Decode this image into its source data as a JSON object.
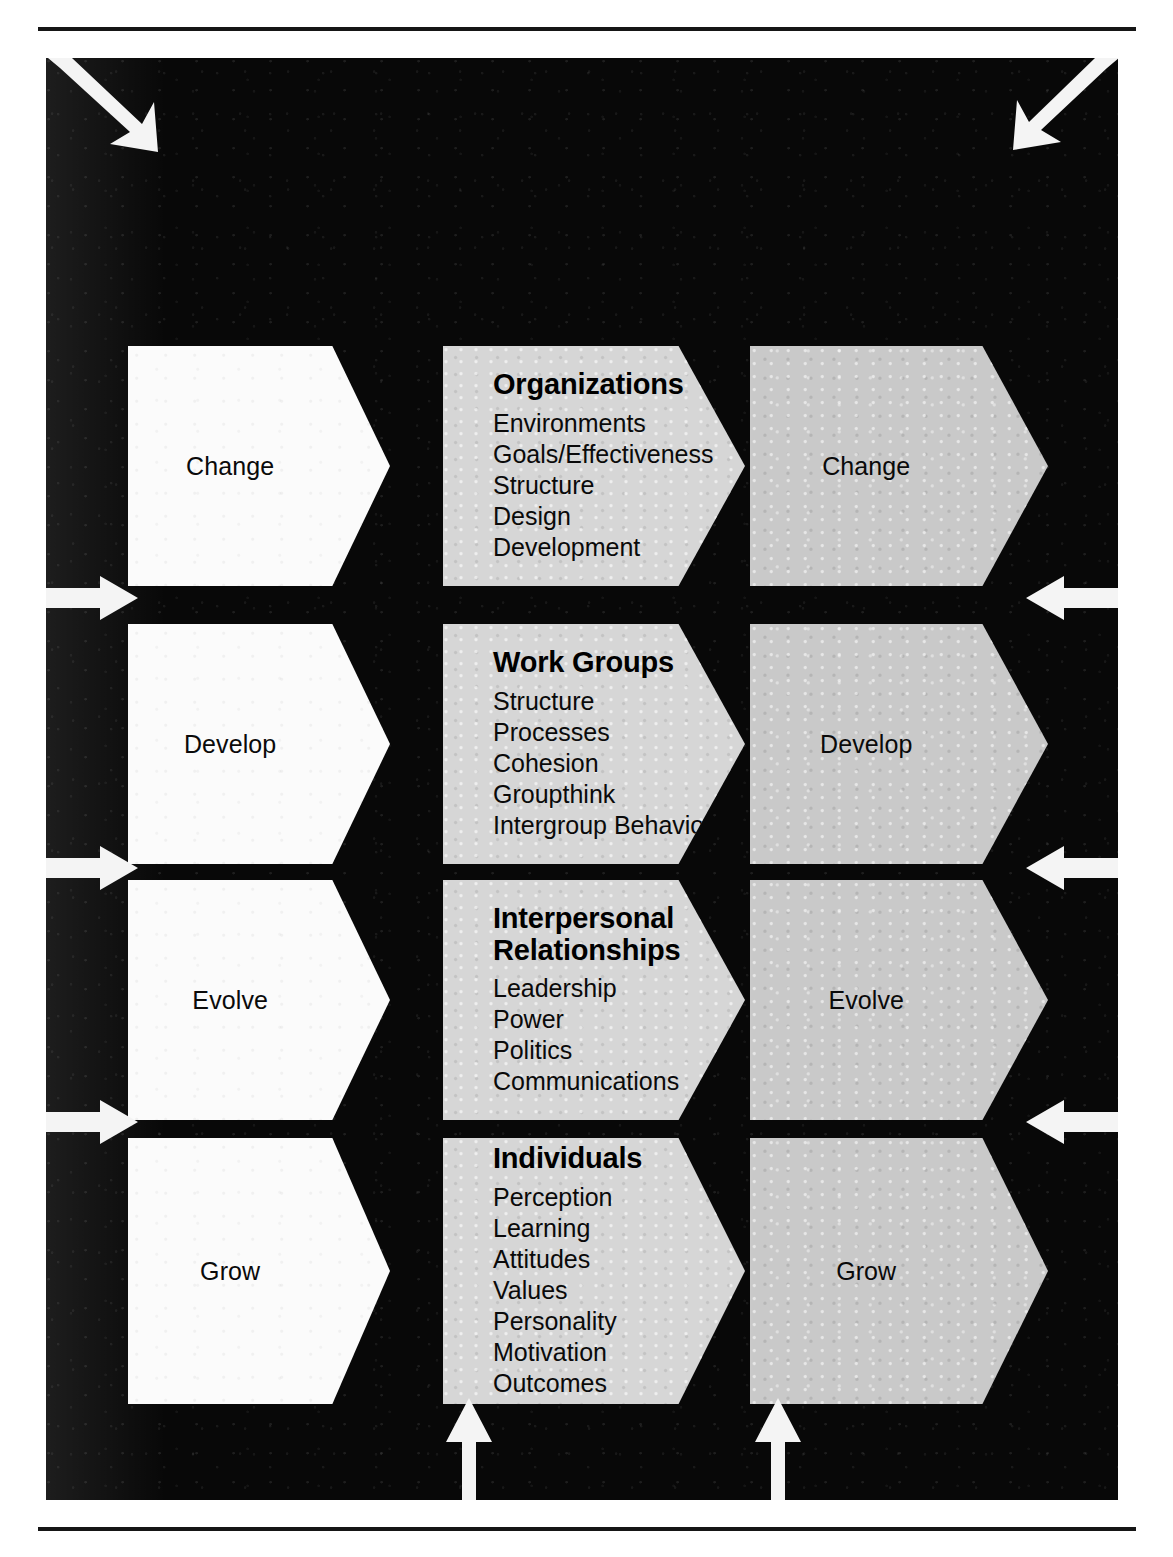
{
  "figure": {
    "panel_bg": "#080808",
    "accent_white": "#fbfbfb",
    "accent_gray": "#c9c9c9",
    "rows": [
      {
        "left_label": "Change",
        "right_label": "Change",
        "title": "Organizations",
        "items": [
          "Environments",
          "Goals/Effectiveness",
          "Structure",
          "Design",
          "Development"
        ]
      },
      {
        "left_label": "Develop",
        "right_label": "Develop",
        "title": "Work Groups",
        "items": [
          "Structure",
          "Processes",
          "Cohesion",
          "Groupthink",
          "Intergroup Behavior"
        ]
      },
      {
        "left_label": "Evolve",
        "right_label": "Evolve",
        "title": "Interpersonal\nRelationships",
        "title_line1": "Interpersonal",
        "title_line2": "Relationships",
        "items": [
          "Leadership",
          "Power",
          "Politics",
          "Communications"
        ]
      },
      {
        "left_label": "Grow",
        "right_label": "Grow",
        "title": "Individuals",
        "items": [
          "Perception",
          "Learning",
          "Attitudes",
          "Values",
          "Personality",
          "Motivation",
          "Outcomes"
        ]
      }
    ],
    "feedback_arrows": [
      {
        "name": "top-left-diagonal-arrow",
        "direction": "down-right"
      },
      {
        "name": "top-right-diagonal-arrow",
        "direction": "down-left"
      },
      {
        "name": "left-feedback-arrow-1",
        "direction": "right"
      },
      {
        "name": "left-feedback-arrow-2",
        "direction": "right"
      },
      {
        "name": "left-feedback-arrow-3",
        "direction": "right"
      },
      {
        "name": "right-feedback-arrow-1",
        "direction": "left"
      },
      {
        "name": "right-feedback-arrow-2",
        "direction": "left"
      },
      {
        "name": "right-feedback-arrow-3",
        "direction": "left"
      },
      {
        "name": "bottom-feedback-arrow-1",
        "direction": "up"
      },
      {
        "name": "bottom-feedback-arrow-2",
        "direction": "up"
      }
    ]
  }
}
